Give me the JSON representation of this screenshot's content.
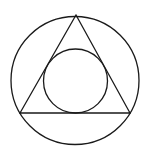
{
  "figure": {
    "width": 148,
    "height": 155,
    "background": "#ffffff",
    "stroke_color": "#1a1a1a",
    "stroke_width": 1.3,
    "shapes": {
      "outer_circle": {
        "cx": 75,
        "cy": 80.5,
        "r": 64
      },
      "triangle": {
        "points": [
          [
            76,
            15
          ],
          [
            20,
            113
          ],
          [
            130,
            113
          ]
        ]
      },
      "inner_circle": {
        "cx": 75.5,
        "cy": 81,
        "r": 32
      }
    }
  }
}
